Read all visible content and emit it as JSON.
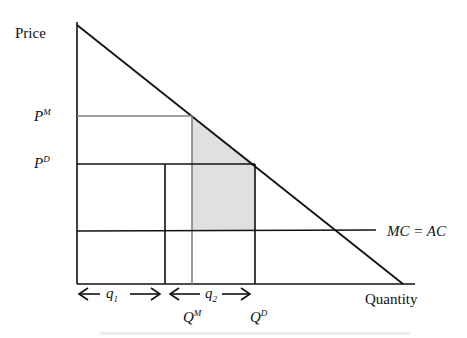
{
  "diagram": {
    "axes": {
      "y_label": "Price",
      "x_label": "Quantity"
    },
    "price_labels": {
      "monopoly": {
        "base": "P",
        "sup": "M"
      },
      "duopoly": {
        "base": "P",
        "sup": "D"
      }
    },
    "quantity_labels": {
      "monopoly": {
        "base": "Q",
        "sup": "M"
      },
      "duopoly": {
        "base": "Q",
        "sup": "D"
      }
    },
    "interval_labels": {
      "q1": {
        "base": "q",
        "sub": "1"
      },
      "q2": {
        "base": "q",
        "sub": "2"
      }
    },
    "cost_label": "MC = AC",
    "curves": [
      "demand (downward sloping)",
      "MC = AC (horizontal)"
    ],
    "shaded_region": "area between Q^M and Q^D under demand, above MC = AC",
    "colors": {
      "line": "#111111",
      "monopoly_lines": "#808080",
      "shade": "#e0e0e0"
    }
  }
}
